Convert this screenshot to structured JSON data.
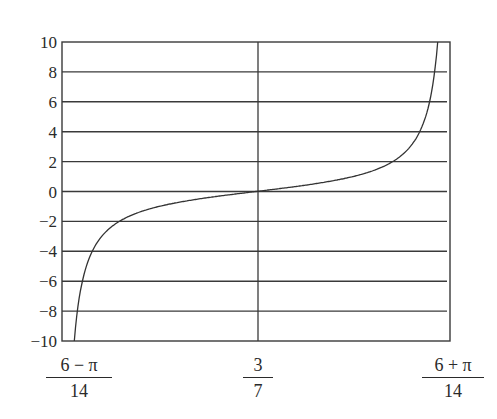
{
  "chart_data": {
    "type": "line",
    "title": "",
    "xlabel": "",
    "ylabel": "",
    "function": "y = tan(7x - 3)",
    "xlim": [
      "(6 - π)/14",
      "(6 + π)/14"
    ],
    "xlim_numeric": [
      0.2042,
      0.653
    ],
    "ylim": [
      -10,
      10
    ],
    "grid": {
      "horizontal": true,
      "vertical": false
    },
    "legend": null,
    "x_tick_labels": [
      {
        "num": "6 − π",
        "den": "14",
        "value": 0.2042
      },
      {
        "num": "3",
        "den": "7",
        "value": 0.4286
      },
      {
        "num": "6 + π",
        "den": "14",
        "value": 0.653
      }
    ],
    "y_ticks": [
      10,
      8,
      6,
      4,
      2,
      0,
      -2,
      -4,
      -6,
      -8,
      -10
    ],
    "y_tick_labels": [
      "10",
      "8",
      "6",
      "4",
      "2",
      "0",
      "−2",
      "−4",
      "−6",
      "−8",
      "−10"
    ],
    "series": [
      {
        "name": "tan(7x − 3)",
        "x": [
          0.214,
          0.2156,
          0.2187,
          0.2247,
          0.2344,
          0.253,
          0.28,
          0.32,
          0.37,
          0.4286,
          0.4872,
          0.5372,
          0.5772,
          0.6042,
          0.6228,
          0.6325,
          0.6385,
          0.6416,
          0.6432
        ],
        "y": [
          -10,
          -8,
          -6,
          -4,
          -2,
          -1.07,
          -0.7,
          -0.43,
          -0.19,
          0,
          0.19,
          0.43,
          0.7,
          1.07,
          2,
          4,
          6,
          8,
          10
        ]
      }
    ],
    "vertical_reference_line": {
      "x": "3/7"
    }
  }
}
